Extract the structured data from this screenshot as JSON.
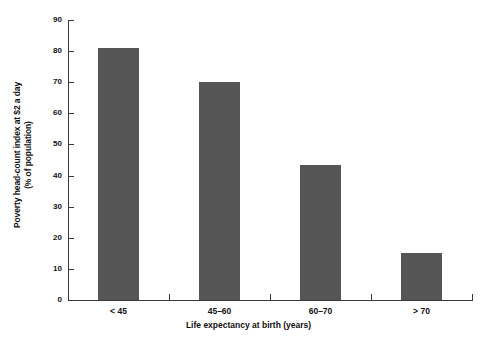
{
  "chart_data": {
    "type": "bar",
    "title": "",
    "categories": [
      "< 45",
      "45–60",
      "60–70",
      "> 70"
    ],
    "values": [
      81,
      70,
      43.5,
      15
    ],
    "xlabel": "Life expectancy at birth (years)",
    "ylabel_line1": "Poverty head-count index at $2 a day",
    "ylabel_line2": "(% of population)",
    "ylim": [
      0,
      90
    ],
    "ytick_values": [
      0,
      10,
      20,
      30,
      40,
      50,
      60,
      70,
      80,
      90
    ],
    "ytick_labels": [
      "0",
      "10",
      "20",
      "30",
      "40",
      "50",
      "60",
      "70",
      "80",
      "90"
    ],
    "grid": false,
    "legend": null,
    "bar_color": "#555555",
    "axis_color": "#3a3a3a",
    "background": "#ffffff"
  }
}
